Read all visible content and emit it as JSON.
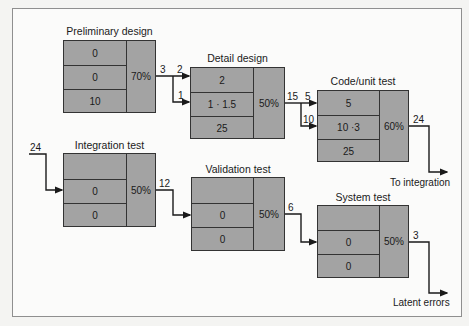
{
  "diagram": {
    "stages": [
      {
        "id": "prelim",
        "title": "Preliminary design",
        "rows": [
          "0",
          "0",
          "10"
        ],
        "efficiency": "70%"
      },
      {
        "id": "detail",
        "title": "Detail design",
        "rows": [
          "2",
          "1 · 1.5",
          "25"
        ],
        "efficiency": "50%"
      },
      {
        "id": "code",
        "title": "Code/unit test",
        "rows": [
          "5",
          "10 ·3",
          "25"
        ],
        "efficiency": "60%"
      },
      {
        "id": "integration",
        "title": "Integration test",
        "rows": [
          "",
          "0",
          "0"
        ],
        "efficiency": "50%"
      },
      {
        "id": "validation",
        "title": "Validation test",
        "rows": [
          "",
          "0",
          "0"
        ],
        "efficiency": "50%"
      },
      {
        "id": "system",
        "title": "System test",
        "rows": [
          "",
          "0",
          "0"
        ],
        "efficiency": "50%"
      }
    ],
    "flow_labels": {
      "prelim_out": "3",
      "detail_in_top": "2",
      "detail_in_mid": "1",
      "detail_out": "15",
      "code_in_top": "5",
      "code_in_mid": "10",
      "code_out": "24",
      "integration_in": "24",
      "integration_out": "12",
      "validation_out": "6",
      "system_out": "3"
    },
    "outputs": {
      "to_integration": "To integration",
      "latent_errors": "Latent errors"
    },
    "colors": {
      "box_fill": "#a3a3a3",
      "line": "#1a1a1a",
      "background": "#fbfbfa"
    }
  }
}
